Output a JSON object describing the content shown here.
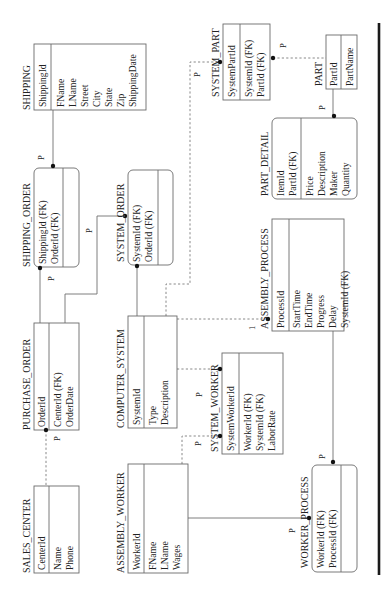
{
  "diagram": {
    "orientation": "rotated-90-ccw",
    "entities": [
      {
        "id": "shipping",
        "name": "SHIPPING",
        "shape": "rect",
        "keys": [
          "ShippingId"
        ],
        "attributes": [
          "FName",
          "LName",
          "Street",
          "City",
          "State",
          "Zip",
          "ShippingDate"
        ]
      },
      {
        "id": "shipping_order",
        "name": "SHIPPING_ORDER",
        "shape": "rounded",
        "keys": [
          "ShippingId (FK)",
          "OrderId (FK)"
        ],
        "attributes": []
      },
      {
        "id": "system_order",
        "name": "SYSTEM_ORDER",
        "shape": "rounded",
        "keys": [
          "SystemId (FK)",
          "OrderId (FK)"
        ],
        "attributes": []
      },
      {
        "id": "purchase_order",
        "name": "PURCHASE_ORDER",
        "shape": "rect",
        "keys": [
          "OrderId"
        ],
        "attributes": [
          "CenterId (FK)",
          "OrderDate"
        ]
      },
      {
        "id": "computer_system",
        "name": "COMPUTER_SYSTEM",
        "shape": "rect",
        "keys": [
          "SystemId"
        ],
        "attributes": [
          "Type",
          "Description"
        ]
      },
      {
        "id": "sales_center",
        "name": "SALES_CENTER",
        "shape": "rect",
        "keys": [
          "CenterId"
        ],
        "attributes": [
          "Name",
          "Phone"
        ]
      },
      {
        "id": "assembly_worker",
        "name": "ASSEMBLY_WORKER",
        "shape": "rect",
        "keys": [
          "WorkerId"
        ],
        "attributes": [
          "FName",
          "LName",
          "Wages"
        ]
      },
      {
        "id": "system_worker",
        "name": "SYSTEM_WORKER",
        "shape": "rect",
        "keys": [
          "SystemWorkerId"
        ],
        "attributes": [
          "WorkerId (FK)",
          "SystemId (FK)",
          "LaborRate"
        ]
      },
      {
        "id": "assembly_process",
        "name": "ASSEMBLY_PROCESS",
        "shape": "rect",
        "keys": [
          "ProcessId"
        ],
        "attributes": [
          "StartTime",
          "EndTime",
          "Progress",
          "Delay",
          "SystemId (FK)"
        ]
      },
      {
        "id": "worker_process",
        "name": "WORKER_PROCESS",
        "shape": "rounded",
        "keys": [
          "WorkerId (FK)",
          "ProcessId (FK)"
        ],
        "attributes": []
      },
      {
        "id": "system_part",
        "name": "SYSTEM_PART",
        "shape": "rect",
        "keys": [
          "SystemPartId"
        ],
        "attributes": [
          "SystemId (FK)",
          "PartId (FK)"
        ]
      },
      {
        "id": "part",
        "name": "PART",
        "shape": "rect",
        "keys": [
          "PartId"
        ],
        "attributes": [
          "PartName"
        ]
      },
      {
        "id": "part_detail",
        "name": "PART_DETAIL",
        "shape": "rounded",
        "keys": [
          "ItemId",
          "PartId (FK)"
        ],
        "attributes": [
          "Price",
          "Description",
          "Maker",
          "Quantity"
        ]
      }
    ],
    "relationships": [
      {
        "from": "SHIPPING",
        "to": "SHIPPING_ORDER",
        "style": "identifying",
        "cardinality": "P"
      },
      {
        "from": "PURCHASE_ORDER",
        "to": "SHIPPING_ORDER",
        "style": "identifying",
        "cardinality": "P"
      },
      {
        "from": "PURCHASE_ORDER",
        "to": "SYSTEM_ORDER",
        "style": "identifying",
        "cardinality": "P"
      },
      {
        "from": "COMPUTER_SYSTEM",
        "to": "SYSTEM_ORDER",
        "style": "identifying",
        "cardinality": ""
      },
      {
        "from": "SALES_CENTER",
        "to": "PURCHASE_ORDER",
        "style": "non-identifying",
        "cardinality": "P"
      },
      {
        "from": "COMPUTER_SYSTEM",
        "to": "SYSTEM_PART",
        "style": "non-identifying",
        "cardinality": "P"
      },
      {
        "from": "PART",
        "to": "SYSTEM_PART",
        "style": "non-identifying",
        "cardinality": "P"
      },
      {
        "from": "PART",
        "to": "PART_DETAIL",
        "style": "identifying",
        "cardinality": "P"
      },
      {
        "from": "COMPUTER_SYSTEM",
        "to": "ASSEMBLY_PROCESS",
        "style": "non-identifying",
        "cardinality": "1"
      },
      {
        "from": "COMPUTER_SYSTEM",
        "to": "SYSTEM_WORKER",
        "style": "non-identifying",
        "cardinality": "P"
      },
      {
        "from": "ASSEMBLY_WORKER",
        "to": "SYSTEM_WORKER",
        "style": "non-identifying",
        "cardinality": "P"
      },
      {
        "from": "ASSEMBLY_WORKER",
        "to": "WORKER_PROCESS",
        "style": "identifying",
        "cardinality": "P"
      },
      {
        "from": "ASSEMBLY_PROCESS",
        "to": "WORKER_PROCESS",
        "style": "identifying",
        "cardinality": "P"
      }
    ],
    "labels": {
      "p": "P",
      "one": "1"
    }
  }
}
